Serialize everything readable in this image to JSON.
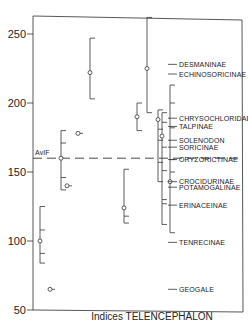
{
  "chart_data": {
    "type": "scatter",
    "title": "",
    "xlabel": "Indices TELENCEPHALON",
    "ylabel": "",
    "ylim": [
      50,
      260
    ],
    "yticks": [
      50,
      100,
      150,
      200,
      250
    ],
    "grid": false,
    "reference_line": {
      "label": "AvIF",
      "value": 160
    },
    "columns": [
      {
        "mean": 100,
        "max": 125,
        "min": 84,
        "ticks": [
          108,
          91
        ]
      },
      {
        "mean": 160,
        "max": 180,
        "min": 137,
        "ticks": [
          171,
          146
        ]
      },
      {
        "mean": 65,
        "max": null,
        "min": null,
        "ticks": []
      },
      {
        "mean": 178,
        "max": null,
        "min": null,
        "ticks": []
      },
      {
        "mean": 140,
        "max": null,
        "min": null,
        "ticks": []
      },
      {
        "mean": 222,
        "max": 247,
        "min": 203,
        "ticks": []
      },
      {
        "mean": 124,
        "max": 152,
        "min": 113,
        "ticks": [
          118
        ]
      },
      {
        "mean": 190,
        "max": 200,
        "min": 180,
        "ticks": []
      },
      {
        "mean": 225,
        "max": 262,
        "min": 193,
        "ticks": []
      },
      {
        "mean": 188,
        "max": 195,
        "min": 143,
        "ticks": [
          181,
          173,
          157
        ]
      },
      {
        "mean": 176,
        "max": 193,
        "min": 112,
        "ticks": [
          186,
          168,
          151,
          127,
          130
        ]
      },
      {
        "mean": 143,
        "max": 213,
        "min": 106,
        "ticks": [
          200,
          182,
          159,
          150
        ]
      }
    ],
    "legend_labels": [
      {
        "label": "DESMANINAE",
        "value": 228
      },
      {
        "label": "ECHINOSORICINAE",
        "value": 221
      },
      {
        "label": "CHRYSOCHLORIDAE",
        "value": 189
      },
      {
        "label": "TALPINAE",
        "value": 183
      },
      {
        "label": "SOLENODON",
        "value": 173
      },
      {
        "label": "SORICINAE",
        "value": 168
      },
      {
        "label": "ORYZORICTINAE",
        "value": 159
      },
      {
        "label": "CROCIDURINAE",
        "value": 143
      },
      {
        "label": "POTAMOGALINAE",
        "value": 139
      },
      {
        "label": "ERINACEINAE",
        "value": 126
      },
      {
        "label": "TENRECINAE",
        "value": 99
      },
      {
        "label": "GEOGALE",
        "value": 65
      }
    ]
  }
}
